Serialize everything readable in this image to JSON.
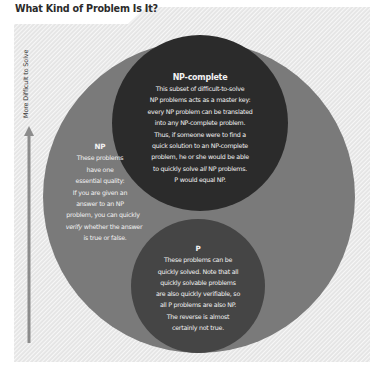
{
  "title": "What Kind of Problem Is It?",
  "axis": {
    "label": "More Difficult to Solve",
    "direction": "up"
  },
  "colors": {
    "hatch_background": "#e6e6e6",
    "hatch_stripe": "#ffffff",
    "np_circle": "#7a7a7a",
    "np_complete_circle": "#2b2b2b",
    "p_circle": "#454545",
    "arrow": "#8c8c8c",
    "text_light": "#f2f2f2",
    "title_text": "#2b2b2b"
  },
  "regions": {
    "np": {
      "title": "NP",
      "lines": [
        "These problems",
        "have one",
        "essential quality:",
        "If you are given an",
        "answer to an NP",
        "problem, you can quickly"
      ],
      "line_verify_em": "verify",
      "line_verify_rest": " whether the answer",
      "line_last": "is true or false."
    },
    "np_complete": {
      "title": "NP-complete",
      "lines": [
        "This subset of difficult-to-solve",
        "NP problems acts as a master key:",
        "every NP problem can be translated",
        "into any NP-complete problem.",
        "Thus, if someone were to find a",
        "quick solution to an NP-complete",
        "problem, he or she would be able"
      ],
      "line_all_pre": "to quickly solve ",
      "line_all_em": "all",
      "line_all_post": " NP problems.",
      "line_last": "P would equal NP."
    },
    "p": {
      "title": "P",
      "lines": [
        "These problems can be",
        "quickly solved. Note that all",
        "quickly solvable problems",
        "are also quickly verifiable, so",
        "all P problems are also NP.",
        "The reverse is almost",
        "certainly not true."
      ]
    }
  }
}
